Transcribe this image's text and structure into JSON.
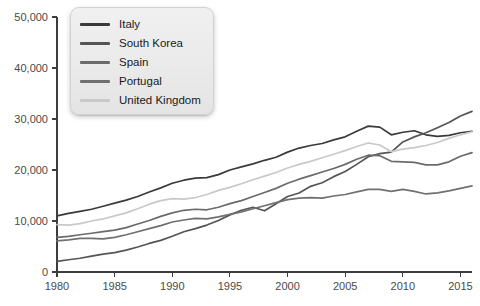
{
  "chart_data": {
    "type": "line",
    "title": "",
    "xlabel": "",
    "ylabel": "",
    "xlim": [
      1980,
      2016
    ],
    "ylim": [
      0,
      50000
    ],
    "grid": false,
    "legend_position": "top-left",
    "x_ticks": [
      "1980",
      "1985",
      "1990",
      "1995",
      "2000",
      "2005",
      "2010",
      "2015"
    ],
    "x_tick_values": [
      1980,
      1985,
      1990,
      1995,
      2000,
      2005,
      2010,
      2015
    ],
    "y_ticks": [
      "0",
      "10,000",
      "20,000",
      "30,000",
      "40,000",
      "50,000"
    ],
    "y_tick_values": [
      0,
      10000,
      20000,
      30000,
      40000,
      50000
    ],
    "x": [
      1980,
      1981,
      1982,
      1983,
      1984,
      1985,
      1986,
      1987,
      1988,
      1989,
      1990,
      1991,
      1992,
      1993,
      1994,
      1995,
      1996,
      1997,
      1998,
      1999,
      2000,
      2001,
      2002,
      2003,
      2004,
      2005,
      2006,
      2007,
      2008,
      2009,
      2010,
      2011,
      2012,
      2013,
      2014,
      2015,
      2016
    ],
    "series": [
      {
        "name": "Italy",
        "color": "#3a3a3a",
        "values": [
          11000,
          11500,
          11900,
          12300,
          12900,
          13500,
          14100,
          14800,
          15700,
          16500,
          17400,
          18000,
          18400,
          18500,
          19100,
          20000,
          20600,
          21200,
          21900,
          22500,
          23500,
          24300,
          24800,
          25200,
          25900,
          26500,
          27600,
          28600,
          28400,
          26900,
          27400,
          27700,
          26900,
          26600,
          26800,
          27300,
          27600
        ]
      },
      {
        "name": "South Korea",
        "color": "#555555",
        "values": [
          2100,
          2400,
          2700,
          3100,
          3500,
          3800,
          4300,
          4900,
          5600,
          6200,
          7000,
          7900,
          8500,
          9200,
          10100,
          11200,
          12100,
          12700,
          12000,
          13400,
          14800,
          15500,
          16800,
          17500,
          18700,
          19700,
          21100,
          22600,
          23200,
          23500,
          25500,
          26500,
          27300,
          28300,
          29300,
          30600,
          31500
        ]
      },
      {
        "name": "Spain",
        "color": "#6b6b6b",
        "values": [
          6800,
          7000,
          7300,
          7600,
          7900,
          8200,
          8700,
          9400,
          10100,
          10900,
          11600,
          12100,
          12300,
          12200,
          12700,
          13400,
          14000,
          14800,
          15600,
          16400,
          17400,
          18200,
          18900,
          19600,
          20300,
          21100,
          22100,
          22900,
          22800,
          21700,
          21600,
          21500,
          21000,
          21000,
          21600,
          22700,
          23400
        ]
      },
      {
        "name": "Portugal",
        "color": "#707070",
        "values": [
          6100,
          6300,
          6600,
          6600,
          6500,
          6800,
          7300,
          7900,
          8500,
          9100,
          9800,
          10200,
          10500,
          10400,
          10800,
          11300,
          11800,
          12400,
          13000,
          13600,
          14200,
          14500,
          14600,
          14500,
          14900,
          15200,
          15700,
          16200,
          16200,
          15800,
          16200,
          15800,
          15300,
          15500,
          15900,
          16400,
          16900
        ]
      },
      {
        "name": "United Kingdom",
        "color": "#c9c9c9",
        "values": [
          9300,
          9200,
          9500,
          10000,
          10400,
          11000,
          11600,
          12400,
          13300,
          14000,
          14400,
          14300,
          14600,
          15200,
          16000,
          16600,
          17300,
          18100,
          18800,
          19500,
          20400,
          21100,
          21700,
          22400,
          23100,
          23800,
          24600,
          25300,
          24900,
          23600,
          24100,
          24400,
          24800,
          25400,
          26200,
          26900,
          27500
        ]
      }
    ]
  },
  "legend": {
    "items": [
      {
        "label": "Italy",
        "color": "#3a3a3a"
      },
      {
        "label": "South Korea",
        "color": "#555555"
      },
      {
        "label": "Spain",
        "color": "#6b6b6b"
      },
      {
        "label": "Portugal",
        "color": "#707070"
      },
      {
        "label": "United Kingdom",
        "color": "#c9c9c9"
      }
    ]
  }
}
